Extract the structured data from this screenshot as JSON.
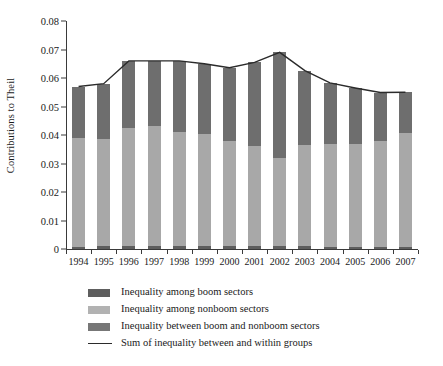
{
  "chart_data": {
    "type": "bar",
    "stacked": true,
    "title": "",
    "xlabel": "",
    "ylabel": "Contributions to Theil",
    "ylim": [
      0,
      0.08
    ],
    "ytick_labels": [
      "0",
      "0.01",
      "0.02",
      "0.03",
      "0.04",
      "0.05",
      "0.06",
      "0.07",
      "0.08"
    ],
    "ytick_values": [
      0,
      0.01,
      0.02,
      0.03,
      0.04,
      0.05,
      0.06,
      0.07,
      0.08
    ],
    "grid": false,
    "legend_position": "below",
    "categories": [
      "1994",
      "1995",
      "1996",
      "1997",
      "1998",
      "1999",
      "2000",
      "2001",
      "2002",
      "2003",
      "2004",
      "2005",
      "2006",
      "2007"
    ],
    "series": [
      {
        "name": "Inequality between boom and nonboom sectors",
        "key": "between",
        "color": "#5e5e5e",
        "values": [
          0.0008,
          0.001,
          0.0012,
          0.001,
          0.001,
          0.001,
          0.0009,
          0.0009,
          0.001,
          0.0009,
          0.0008,
          0.0008,
          0.0008,
          0.0008
        ]
      },
      {
        "name": "Inequality among nonboom sectors",
        "key": "nonboom",
        "color": "#a8a8a8",
        "values": [
          0.0383,
          0.0375,
          0.0413,
          0.042,
          0.0402,
          0.0392,
          0.037,
          0.0351,
          0.0311,
          0.0355,
          0.036,
          0.0362,
          0.0372,
          0.0398
        ]
      },
      {
        "name": "Inequality among boom sectors",
        "key": "boom",
        "color": "#6e6e6e",
        "values": [
          0.0179,
          0.0195,
          0.0235,
          0.023,
          0.0248,
          0.0248,
          0.0257,
          0.0295,
          0.0369,
          0.0262,
          0.0215,
          0.0195,
          0.0169,
          0.0144
        ]
      }
    ],
    "line_series": {
      "name": "Sum of inequality between and within groups",
      "color": "#2b2b2b",
      "values": [
        0.057,
        0.058,
        0.066,
        0.066,
        0.066,
        0.065,
        0.0636,
        0.0655,
        0.069,
        0.0626,
        0.0583,
        0.0565,
        0.0549,
        0.055
      ]
    },
    "legend": [
      {
        "label": "Inequality among boom sectors",
        "marker": "swatch",
        "color": "#5e5e5e"
      },
      {
        "label": "Inequality among nonboom sectors",
        "marker": "swatch",
        "color": "#b2b2b2"
      },
      {
        "label": "Inequality between boom and nonboom sectors",
        "marker": "swatch",
        "color": "#777777"
      },
      {
        "label": "Sum of inequality between and within groups",
        "marker": "line",
        "color": "#2b2b2b"
      }
    ]
  }
}
